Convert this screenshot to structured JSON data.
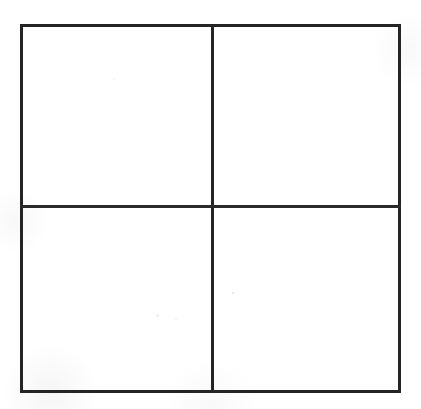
{
  "document": {
    "title": "Blank 2x2 Grid",
    "background_color": "#ffffff",
    "line_color": "#242424",
    "width": 421,
    "height": 409
  },
  "diagram": {
    "type": "2x2-grid",
    "rows": 2,
    "columns": 2,
    "frame": {
      "left": 21,
      "top": 25,
      "right": 400,
      "bottom": 392,
      "stroke_width": 3,
      "stroke_color": "#242424"
    },
    "dividers": {
      "vertical_x": 212,
      "horizontal_y": 206,
      "stroke_width": 3,
      "stroke_color": "#2a2a2a"
    },
    "cells": [
      {
        "id": "top-left",
        "label": "",
        "row": 1,
        "column": 1,
        "content": ""
      },
      {
        "id": "top-right",
        "label": "",
        "row": 1,
        "column": 2,
        "content": ""
      },
      {
        "id": "bottom-left",
        "label": "",
        "row": 2,
        "column": 1,
        "content": ""
      },
      {
        "id": "bottom-right",
        "label": "",
        "row": 2,
        "column": 2,
        "content": ""
      }
    ]
  }
}
